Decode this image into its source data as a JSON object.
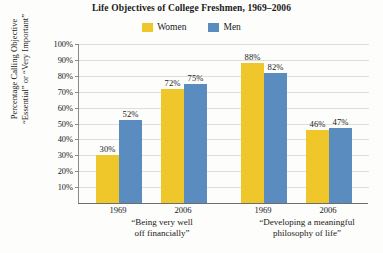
{
  "chart_data": {
    "type": "bar",
    "title": "Life Objectives of College Freshmen, 1969–2006",
    "xlabel": "",
    "ylabel_lines": [
      "Percentage Calling Objective",
      "“Essential” or “Very Important”"
    ],
    "ylim": [
      0,
      100
    ],
    "ytick_labels": [
      "100%",
      "90%",
      "80%",
      "70%",
      "60%",
      "50%",
      "40%",
      "30%",
      "20%",
      "10%"
    ],
    "ytick_values": [
      100,
      90,
      80,
      70,
      60,
      50,
      40,
      30,
      20,
      10
    ],
    "grid": true,
    "legend_position": "top-center",
    "categories": [
      "1969",
      "2006",
      "1969",
      "2006"
    ],
    "groups": [
      {
        "caption_lines": [
          "“Being very well",
          "off financially”"
        ],
        "ticks": [
          "1969",
          "2006"
        ]
      },
      {
        "caption_lines": [
          "“Developing a meaningful",
          "philosophy of life”"
        ],
        "ticks": [
          "1969",
          "2006"
        ]
      }
    ],
    "series": [
      {
        "name": "Women",
        "color": "#efc72a",
        "values": [
          30,
          72,
          88,
          46
        ],
        "value_labels": [
          "30%",
          "72%",
          "88%",
          "46%"
        ]
      },
      {
        "name": "Men",
        "color": "#5b8cc0",
        "values": [
          52,
          75,
          82,
          47
        ],
        "value_labels": [
          "52%",
          "75%",
          "82%",
          "47%"
        ]
      }
    ]
  },
  "legend": {
    "items": [
      {
        "label": "Women",
        "color": "#efc72a"
      },
      {
        "label": "Men",
        "color": "#5b8cc0"
      }
    ]
  }
}
